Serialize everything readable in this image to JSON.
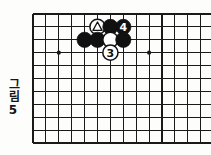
{
  "figure": {
    "caption_label": "그림",
    "caption_number": "5",
    "type": "go-board-diagram"
  },
  "board": {
    "line_color": "#1a1a1a",
    "background_color": "#fdfdfc",
    "origin_x": 33,
    "origin_y": 14,
    "spacing": 12.9,
    "cols": 14,
    "rows": 10,
    "star_points": [
      {
        "col": 2,
        "row": 3
      },
      {
        "col": 9,
        "row": 3
      }
    ]
  },
  "stones": [
    {
      "id": "white-triangle",
      "color": "white",
      "col": 5,
      "row": 1,
      "mark": "triangle",
      "label": ""
    },
    {
      "id": "black-a",
      "color": "black",
      "col": 6,
      "row": 1,
      "mark": "none",
      "label": ""
    },
    {
      "id": "black-move-4",
      "color": "black",
      "col": 7,
      "row": 1,
      "mark": "number",
      "label": "4"
    },
    {
      "id": "black-b",
      "color": "black",
      "col": 4,
      "row": 2,
      "mark": "none",
      "label": ""
    },
    {
      "id": "black-c",
      "color": "black",
      "col": 5,
      "row": 2,
      "mark": "none",
      "label": ""
    },
    {
      "id": "white-a",
      "color": "white",
      "col": 6,
      "row": 2,
      "mark": "none",
      "label": ""
    },
    {
      "id": "black-d",
      "color": "black",
      "col": 7,
      "row": 2,
      "mark": "none",
      "label": ""
    },
    {
      "id": "white-move-3",
      "color": "white",
      "col": 6,
      "row": 3,
      "mark": "number",
      "label": "3"
    }
  ],
  "colors": {
    "black_stone": "#111111",
    "white_stone": "#ffffff",
    "stone_outline": "#111111",
    "grid": "#1a1a1a"
  }
}
